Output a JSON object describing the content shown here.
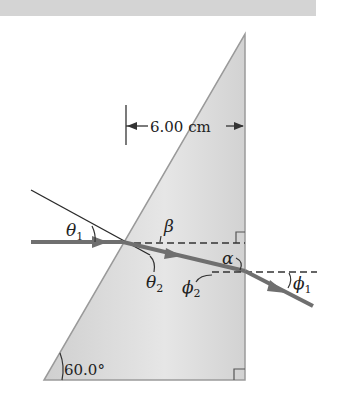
{
  "diagram": {
    "type": "prism-refraction",
    "dimension_label": "6.00 cm",
    "apex_angle_label": "60.0°",
    "angles": {
      "theta1": {
        "symbol": "θ",
        "sub": "1"
      },
      "theta2": {
        "symbol": "θ",
        "sub": "2"
      },
      "beta": {
        "symbol": "β"
      },
      "alpha": {
        "symbol": "α"
      },
      "phi2": {
        "symbol": "ϕ",
        "sub": "2"
      },
      "phi1": {
        "symbol": "ϕ",
        "sub": "1"
      }
    },
    "colors": {
      "prism_fill": "#d9d9d9",
      "prism_edge": "#8a8a8a",
      "ray": "#6f6f6f",
      "lines": "#2a2a2a",
      "top_band": "#d4d4d4"
    }
  }
}
